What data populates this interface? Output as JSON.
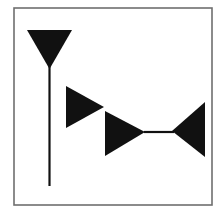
{
  "figure": {
    "width": 223,
    "height": 213,
    "background_color": "#ffffff",
    "ink_color": "#111111",
    "frame": {
      "name": "outer-frame",
      "x": 14,
      "y": 8,
      "width": 198,
      "height": 197,
      "stroke_color": "#6f6f6f",
      "stroke_width": 1.6
    },
    "shapes": [
      {
        "id": "shape-1",
        "name": "down-triangle-with-stem",
        "kind": "triangle",
        "direction": "down",
        "points": "27,30 72,30 49.5,69",
        "label": "Downward pointing triangle (martini glass bowl)",
        "color": "#111111"
      },
      {
        "id": "shape-1-stem",
        "name": "vertical-stem-line",
        "kind": "line",
        "direction": "vertical",
        "x1": 49.5,
        "y1": 66,
        "x2": 49.5,
        "y2": 186,
        "stroke_width": 2.2,
        "label": "Vertical stem under the downward triangle",
        "color": "#111111"
      },
      {
        "id": "shape-2",
        "name": "right-triangle-upper",
        "kind": "triangle",
        "direction": "right",
        "points": "66,86 66,128 104,107",
        "label": "Upper right pointing triangle",
        "color": "#111111"
      },
      {
        "id": "shape-3",
        "name": "right-triangle-lower",
        "kind": "triangle",
        "direction": "right",
        "points": "105,111 105,156 145,132",
        "label": "Lower right pointing triangle",
        "color": "#111111"
      },
      {
        "id": "shape-3-connector",
        "name": "horizontal-connector-line",
        "kind": "line",
        "direction": "horizontal",
        "x1": 144,
        "y1": 132,
        "x2": 174,
        "y2": 132,
        "stroke_width": 2.2,
        "label": "Horizontal line joining lower right triangle to left triangle",
        "color": "#111111"
      },
      {
        "id": "shape-4",
        "name": "left-triangle",
        "kind": "triangle",
        "direction": "left",
        "points": "205,102 205,157 172,131",
        "label": "Left pointing triangle",
        "color": "#111111"
      }
    ]
  }
}
